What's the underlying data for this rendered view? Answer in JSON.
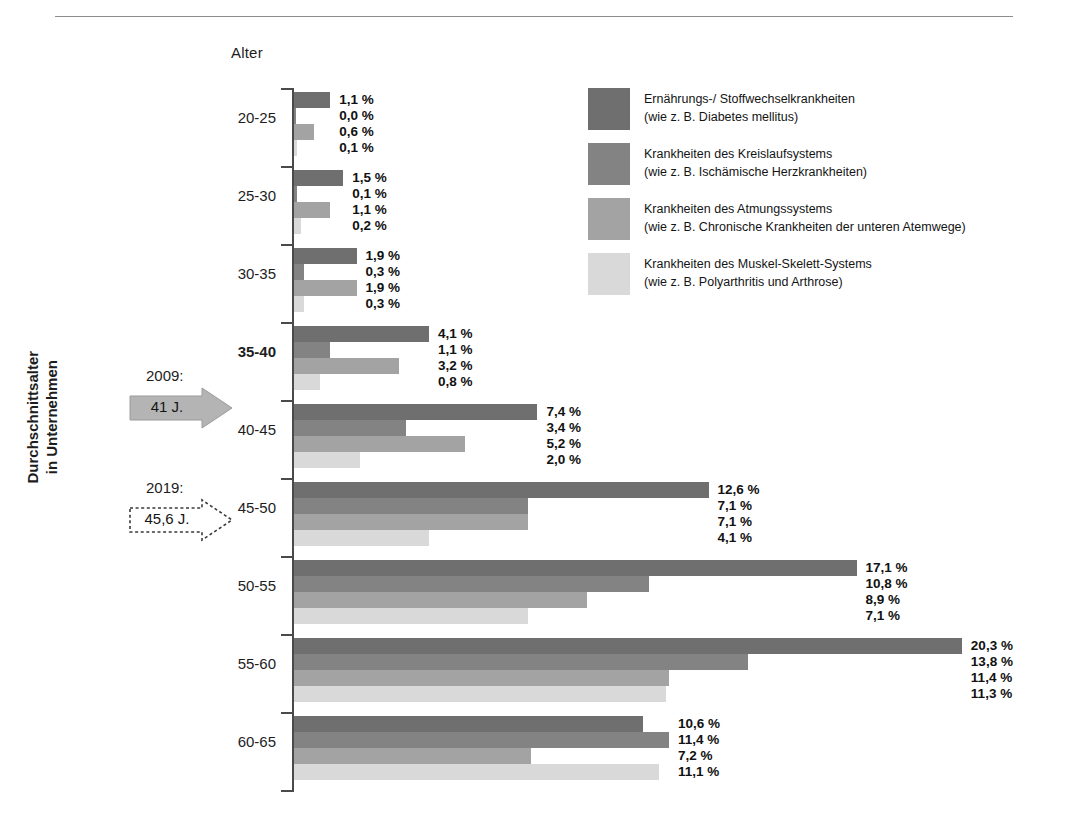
{
  "axis_title": "Alter",
  "vertical_label": "Durchschnittsalter\nin Unternehmen",
  "vertical_label_line1": "Durchschnittsalter",
  "vertical_label_line2": "in Unternehmen",
  "annotations": [
    {
      "name": "arrow-2009",
      "year": "2009:",
      "value": "41 J.",
      "style": "filled"
    },
    {
      "name": "arrow-2019",
      "year": "2019:",
      "value": "45,6 J.",
      "style": "dashed"
    }
  ],
  "legend": [
    {
      "title": "Ernährungs-/ Stoffwechselkrankheiten",
      "sub": "(wie z. B. Diabetes mellitus)",
      "color": "#6f6f6f"
    },
    {
      "title": "Krankheiten des Kreislaufsystems",
      "sub": "(wie z. B. Ischämische Herzkrankheiten)",
      "color": "#838383"
    },
    {
      "title": "Krankheiten des Atmungssystems",
      "sub": "(wie z. B. Chronische Krankheiten der unteren Atemwege)",
      "color": "#a3a3a3"
    },
    {
      "title": "Krankheiten des Muskel-Skelett-Systems",
      "sub": "(wie z. B. Polyarthritis und Arthrose)",
      "color": "#d9d9d9"
    }
  ],
  "chart_data": {
    "type": "bar",
    "orientation": "horizontal",
    "title": "",
    "xlabel": "",
    "ylabel": "Alter",
    "grid": false,
    "legend_position": "right",
    "value_unit": "%",
    "categories": [
      "20-25",
      "25-30",
      "30-35",
      "35-40",
      "40-45",
      "45-50",
      "50-55",
      "55-60",
      "60-65"
    ],
    "highlight_category": "35-40",
    "series": [
      {
        "name": "Ernährungs-/ Stoffwechselkrankheiten",
        "color": "#6f6f6f",
        "values": [
          1.1,
          1.5,
          1.9,
          4.1,
          7.4,
          12.6,
          17.1,
          20.3,
          10.6
        ],
        "labels": [
          "1,1 %",
          "1,5 %",
          "1,9 %",
          "4,1 %",
          "7,4 %",
          "12,6 %",
          "17,1 %",
          "20,3 %",
          "10,6 %"
        ]
      },
      {
        "name": "Krankheiten des Kreislaufsystems",
        "color": "#838383",
        "values": [
          0.0,
          0.1,
          0.3,
          1.1,
          3.4,
          7.1,
          10.8,
          13.8,
          11.4
        ],
        "labels": [
          "0,0 %",
          "0,1 %",
          "0,3 %",
          "1,1 %",
          "3,4 %",
          "7,1 %",
          "10,8 %",
          "13,8 %",
          "11,4 %"
        ]
      },
      {
        "name": "Krankheiten des Atmungssystems",
        "color": "#a3a3a3",
        "values": [
          0.6,
          1.1,
          1.9,
          3.2,
          5.2,
          7.1,
          8.9,
          11.4,
          7.2
        ],
        "labels": [
          "0,6 %",
          "1,1 %",
          "1,9 %",
          "3,2 %",
          "5,2 %",
          "7,1 %",
          "8,9 %",
          "11,4 %",
          "7,2 %"
        ]
      },
      {
        "name": "Krankheiten des Muskel-Skelett-Systems",
        "color": "#d9d9d9",
        "values": [
          0.1,
          0.2,
          0.3,
          0.8,
          2.0,
          4.1,
          7.1,
          11.3,
          11.1
        ],
        "labels": [
          "0,1 %",
          "0,2 %",
          "0,3 %",
          "0,8 %",
          "2,0 %",
          "4,1 %",
          "7,1 %",
          "11,3 %",
          "11,1 %"
        ]
      }
    ],
    "xlim": [
      0,
      21
    ],
    "px_per_unit": 32.9
  }
}
